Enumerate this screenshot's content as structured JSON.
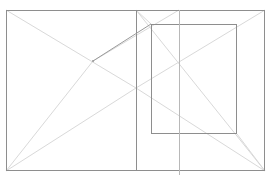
{
  "caption": {
    "visible": "clipped",
    "text": ""
  },
  "diagram": {
    "outer_rect": {
      "x1": 6,
      "y1": 10,
      "x2": 265,
      "y2": 171
    },
    "inner_rect": {
      "x1": 151,
      "y1": 24,
      "x2": 237,
      "y2": 134
    },
    "vertical_lines": [
      {
        "x": 136,
        "y1": 10,
        "y2": 171,
        "color": "#8f8f8f"
      },
      {
        "x": 179,
        "y1": 10,
        "y2": 175,
        "color": "#b5b5b5"
      }
    ],
    "point_p": {
      "x": 93,
      "y": 61
    },
    "colors": {
      "dark_stroke": "#8a8a8a",
      "light_stroke": "#d6d6d6",
      "medium_stroke": "#a8a8a8"
    }
  }
}
